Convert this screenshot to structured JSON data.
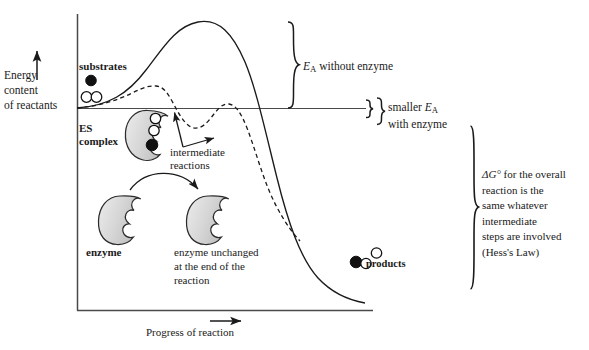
{
  "figure": {
    "axes": {
      "y_label_lines": [
        "Energy",
        "content",
        "of reactants"
      ],
      "y_label": "Energy content of reactants",
      "x_label": "Progress of reaction",
      "y_arrow_icon": "up-arrow-icon",
      "x_arrow_icon": "right-arrow-icon"
    },
    "labels": {
      "substrates": "substrates",
      "es_complex_line1": "ES",
      "es_complex_line2": "complex",
      "intermediate_line1": "intermediate",
      "intermediate_line2": "reactions",
      "enzyme": "enzyme",
      "enzyme_unchanged_line1": "enzyme unchanged",
      "enzyme_unchanged_line2": "at the end of the",
      "enzyme_unchanged_line3": "reaction",
      "products": "products"
    },
    "annotations": {
      "ea_without_enzyme_pre": "E",
      "ea_without_enzyme_sub": "A",
      "ea_without_enzyme_post": " without enzyme",
      "ea_without_enzyme": "EA without enzyme",
      "ea_with_enzyme_line1_pre": "smaller ",
      "ea_with_enzyme_line1_var": "E",
      "ea_with_enzyme_line1_sub": "A",
      "ea_with_enzyme_line2": "with enzyme",
      "ea_with_enzyme": "smaller EA with enzyme",
      "hess_line1_sym": "ΔG°",
      "hess_line1_rest": " for the overall",
      "hess_line2": "reaction is the",
      "hess_line3": "same whatever",
      "hess_line4": "intermediate",
      "hess_line5": "steps are involved",
      "hess_line6": "(Hess's Law)",
      "hess_text": "ΔG° for the overall reaction is the same whatever intermediate steps are involved (Hess's Law)"
    },
    "curves": [
      {
        "name": "without-enzyme",
        "style": "solid",
        "description": "High single-peak activation energy barrier for the uncatalysed reaction",
        "peak_label": "EA without enzyme"
      },
      {
        "name": "with-enzyme",
        "style": "dashed",
        "description": "Two lower peaks separated by an intermediate trough for the enzyme-catalysed reaction",
        "peak_label": "smaller EA with enzyme"
      }
    ],
    "molecules": {
      "substrate_filled_count": 1,
      "substrate_open_count": 2,
      "product_filled_count": 1,
      "product_open_count": 2,
      "es_complex_open_count": 2,
      "es_complex_filled_count": 1
    },
    "colors": {
      "ink": "#1a1a1a",
      "enzyme_fill": "#d9d9d9",
      "enzyme_fill_light": "#e8e8e8",
      "enzyme_stroke": "#2b2b2b",
      "axis": "#4a4a4a",
      "background": "#ffffff"
    },
    "icons": {
      "enzyme_shape": "enzyme-crescent-icon",
      "substrate_filled": "filled-circle-icon",
      "substrate_open": "open-circle-icon",
      "brace_large": "curly-brace-icon",
      "brace_small": "curly-brace-icon",
      "arrow_curved": "curved-arrow-icon",
      "arrow_pointer": "arrow-icon"
    }
  }
}
